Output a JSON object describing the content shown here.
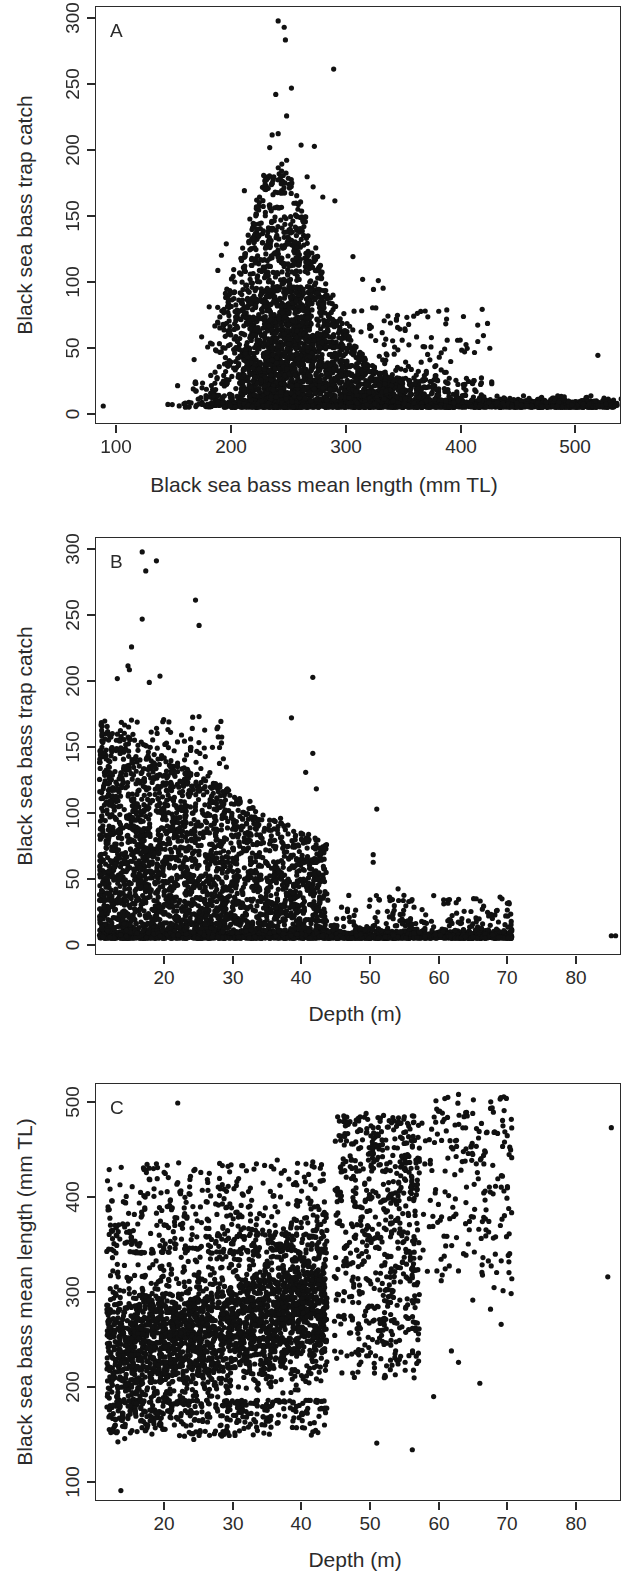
{
  "figure": {
    "background_color": "#ffffff",
    "ink_color": "#2b2b2b",
    "point_color": "#111111",
    "panel_letters": [
      "A",
      "B",
      "C"
    ]
  },
  "chart_data": [
    {
      "type": "scatter",
      "panel": "A",
      "title": "",
      "xlabel": "Black sea bass mean length (mm TL)",
      "ylabel": "Black sea bass trap catch",
      "xlim": [
        92,
        528
      ],
      "ylim": [
        -14,
        316
      ],
      "xticks": [
        100,
        200,
        300,
        400,
        500
      ],
      "xtick_labels": [
        "100",
        "200",
        "300",
        "400",
        "500"
      ],
      "yticks": [
        0,
        50,
        100,
        150,
        200,
        250,
        300
      ],
      "ytick_labels": [
        "0",
        "50",
        "100",
        "150",
        "200",
        "250",
        "300"
      ],
      "grid": false,
      "legend": "none",
      "marker": "filled-circle",
      "marker_size_px": 5,
      "n_points_approx": 4200,
      "description": "Unimodal right-skewed cloud peaking near 240 mm; catch declines sharply above 300 mm; dense floor of near-zero catches from 150-520 mm.",
      "cluster": {
        "mode_x": 243,
        "x_spread_lo": 150,
        "x_spread_hi": 520,
        "floor_y": 0,
        "peak_y": 305
      },
      "notable_points": [
        [
          243,
          305
        ],
        [
          248,
          300
        ],
        [
          249,
          290
        ],
        [
          289,
          267
        ],
        [
          254,
          252
        ],
        [
          241,
          247
        ],
        [
          250,
          230
        ],
        [
          243,
          216
        ],
        [
          238,
          215
        ],
        [
          236,
          205
        ],
        [
          262,
          207
        ],
        [
          273,
          206
        ],
        [
          250,
          195
        ],
        [
          246,
          192
        ],
        [
          231,
          183
        ],
        [
          267,
          182
        ],
        [
          215,
          171
        ],
        [
          272,
          174
        ],
        [
          280,
          166
        ],
        [
          290,
          163
        ],
        [
          200,
          129
        ],
        [
          196,
          120
        ],
        [
          193,
          108
        ],
        [
          305,
          119
        ],
        [
          313,
          101
        ],
        [
          326,
          100
        ],
        [
          322,
          93
        ],
        [
          330,
          94
        ],
        [
          98,
          1
        ],
        [
          508,
          41
        ],
        [
          370,
          55
        ],
        [
          381,
          46
        ],
        [
          348,
          62
        ],
        [
          342,
          63
        ],
        [
          334,
          72
        ],
        [
          420,
          20
        ],
        [
          404,
          19
        ],
        [
          392,
          18
        ],
        [
          519,
          2
        ],
        [
          522,
          1
        ]
      ]
    },
    {
      "type": "scatter",
      "panel": "B",
      "title": "",
      "xlabel": "Depth (m)",
      "ylabel": "Black sea bass trap catch",
      "xlim": [
        12.5,
        86.5
      ],
      "ylim": [
        -14,
        316
      ],
      "xticks": [
        20,
        30,
        40,
        50,
        60,
        70,
        80
      ],
      "xtick_labels": [
        "20",
        "30",
        "40",
        "50",
        "60",
        "70",
        "80"
      ],
      "yticks": [
        0,
        50,
        100,
        150,
        200,
        250,
        300
      ],
      "ytick_labels": [
        "0",
        "50",
        "100",
        "150",
        "200",
        "250",
        "300"
      ],
      "grid": false,
      "legend": "none",
      "marker": "filled-circle",
      "marker_size_px": 5,
      "n_points_approx": 4200,
      "description": "Dense wedge from 13-45 m declining with depth; sparse low catches 45-71 m; isolated pair near 85 m at zero catch.",
      "cluster": {
        "dense_x_lo": 13,
        "dense_x_hi": 45,
        "tail_x_hi": 71,
        "floor_y": 0,
        "peak_y": 305
      },
      "notable_points": [
        [
          19.0,
          305
        ],
        [
          21.0,
          298
        ],
        [
          19.5,
          290
        ],
        [
          26.5,
          267
        ],
        [
          19.0,
          252
        ],
        [
          27.0,
          247
        ],
        [
          17.5,
          230
        ],
        [
          43.0,
          206
        ],
        [
          21.5,
          207
        ],
        [
          15.5,
          205
        ],
        [
          20.0,
          202
        ],
        [
          17.0,
          215
        ],
        [
          17.2,
          212
        ],
        [
          40.0,
          174
        ],
        [
          27.0,
          175
        ],
        [
          43.0,
          146
        ],
        [
          42.0,
          131
        ],
        [
          52.0,
          102
        ],
        [
          43.5,
          118
        ],
        [
          51.5,
          66
        ],
        [
          51.5,
          60
        ],
        [
          55.0,
          39
        ],
        [
          56.5,
          29
        ],
        [
          60.0,
          9
        ],
        [
          66.0,
          13
        ],
        [
          71.0,
          6
        ],
        [
          85.0,
          2
        ],
        [
          85.6,
          2
        ],
        [
          14.0,
          48
        ],
        [
          13.5,
          1
        ]
      ]
    },
    {
      "type": "scatter",
      "panel": "C",
      "title": "",
      "xlabel": "Depth (m)",
      "ylabel": "Black sea bass mean length (mm TL)",
      "xlim": [
        12.5,
        86.5
      ],
      "ylim": [
        88,
        528
      ],
      "xticks": [
        20,
        30,
        40,
        50,
        60,
        70,
        80
      ],
      "xtick_labels": [
        "20",
        "30",
        "40",
        "50",
        "60",
        "70",
        "80"
      ],
      "yticks": [
        100,
        200,
        300,
        400,
        500
      ],
      "ytick_labels": [
        "100",
        "200",
        "300",
        "400",
        "500"
      ],
      "grid": false,
      "legend": "none",
      "marker": "filled-circle",
      "marker_size_px": 5,
      "n_points_approx": 4200,
      "description": "Positive relationship: mean length rises with depth. Dense blob 14-45 m centred near 270 mm; deeper samples 48-70 m shift to 350-520 mm; scattered outliers beyond 80 m.",
      "cluster": {
        "dense_x_lo": 14,
        "dense_x_hi": 45,
        "dense_y_lo": 190,
        "dense_y_hi": 350,
        "deep_x_lo": 48,
        "deep_x_hi": 71,
        "deep_y_lo": 200,
        "deep_y_hi": 520
      },
      "notable_points": [
        [
          24.0,
          508
        ],
        [
          62.0,
          514
        ],
        [
          63.5,
          517
        ],
        [
          85.0,
          482
        ],
        [
          64.5,
          498
        ],
        [
          65.5,
          497
        ],
        [
          68.5,
          477
        ],
        [
          69.0,
          476
        ],
        [
          52.5,
          492
        ],
        [
          50.5,
          497
        ],
        [
          51.5,
          482
        ],
        [
          55.5,
          452
        ],
        [
          57.5,
          448
        ],
        [
          62.0,
          450
        ],
        [
          66.0,
          444
        ],
        [
          21.0,
          444
        ],
        [
          31.5,
          443
        ],
        [
          33.0,
          442
        ],
        [
          38.0,
          448
        ],
        [
          43.0,
          446
        ],
        [
          16.0,
          100
        ],
        [
          52.0,
          150
        ],
        [
          57.0,
          143
        ],
        [
          38.0,
          171
        ],
        [
          27.0,
          158
        ],
        [
          84.5,
          325
        ],
        [
          71.0,
          323
        ],
        [
          68.0,
          291
        ],
        [
          63.5,
          235
        ],
        [
          60.0,
          199
        ],
        [
          62.5,
          247
        ],
        [
          66.5,
          213
        ],
        [
          69.5,
          275
        ],
        [
          15.5,
          162
        ],
        [
          16.5,
          337
        ]
      ]
    }
  ],
  "panels": [
    {
      "letter": "A",
      "xlabel": "Black sea bass mean length (mm TL)",
      "ylabel": "Black sea bass trap catch",
      "xtick_labels": [
        "100",
        "200",
        "300",
        "400",
        "500"
      ],
      "ytick_labels": [
        "0",
        "50",
        "100",
        "150",
        "200",
        "250",
        "300"
      ]
    },
    {
      "letter": "B",
      "xlabel": "Depth (m)",
      "ylabel": "Black sea bass trap catch",
      "xtick_labels": [
        "20",
        "30",
        "40",
        "50",
        "60",
        "70",
        "80"
      ],
      "ytick_labels": [
        "0",
        "50",
        "100",
        "150",
        "200",
        "250",
        "300"
      ]
    },
    {
      "letter": "C",
      "xlabel": "Depth (m)",
      "ylabel": "Black sea bass mean length (mm TL)",
      "xtick_labels": [
        "100",
        "200",
        "300",
        "400",
        "500"
      ],
      "ytick_labels": [
        "100",
        "200",
        "300",
        "400",
        "500"
      ]
    }
  ]
}
